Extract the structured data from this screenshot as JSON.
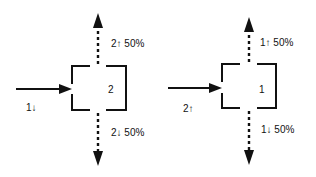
{
  "panels": [
    {
      "id": "left",
      "box_label": "2",
      "input_label": "1↓",
      "up_label": "2↑ 50%",
      "down_label": "2↓ 50%"
    },
    {
      "id": "right",
      "box_label": "1",
      "input_label": "2↑",
      "up_label": "1↑ 50%",
      "down_label": "1↓ 50%"
    }
  ]
}
